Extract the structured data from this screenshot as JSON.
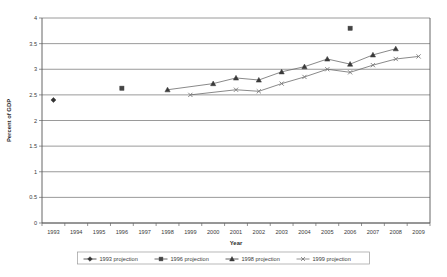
{
  "chart_data": {
    "type": "line",
    "title": "",
    "xlabel": "Year",
    "ylabel": "Percent of GDP",
    "xlim": [
      1993,
      2009
    ],
    "ylim": [
      0,
      4
    ],
    "ytick_step": 0.5,
    "grid": true,
    "legend_position": "bottom",
    "categories": [
      "1993",
      "1994",
      "1995",
      "1996",
      "1997",
      "1998",
      "1999",
      "2000",
      "2001",
      "2002",
      "2003",
      "2004",
      "2005",
      "2006",
      "2007",
      "2008",
      "2009"
    ],
    "ytick_labels": [
      "0",
      "0.5",
      "1",
      "1.5",
      "2",
      "2.5",
      "3",
      "3.5",
      "4"
    ],
    "series": [
      {
        "name": "1993 projection",
        "marker": "diamond",
        "color": "#333333",
        "points": [
          {
            "x": 1993,
            "y": 2.4
          }
        ]
      },
      {
        "name": "1996 projection",
        "marker": "square",
        "color": "#444444",
        "points": [
          {
            "x": 1996,
            "y": 2.63
          },
          {
            "x": 2006,
            "y": 3.8
          }
        ]
      },
      {
        "name": "1998 projection",
        "marker": "triangle",
        "color": "#3a3a3a",
        "points": [
          {
            "x": 1998,
            "y": 2.6
          },
          {
            "x": 2000,
            "y": 2.72
          },
          {
            "x": 2001,
            "y": 2.83
          },
          {
            "x": 2002,
            "y": 2.79
          },
          {
            "x": 2003,
            "y": 2.95
          },
          {
            "x": 2004,
            "y": 3.05
          },
          {
            "x": 2005,
            "y": 3.2
          },
          {
            "x": 2006,
            "y": 3.1
          },
          {
            "x": 2007,
            "y": 3.28
          },
          {
            "x": 2008,
            "y": 3.4
          }
        ]
      },
      {
        "name": "1999 projection",
        "marker": "cross",
        "color": "#7a7a7a",
        "points": [
          {
            "x": 1999,
            "y": 2.5
          },
          {
            "x": 2001,
            "y": 2.6
          },
          {
            "x": 2002,
            "y": 2.57
          },
          {
            "x": 2003,
            "y": 2.72
          },
          {
            "x": 2004,
            "y": 2.85
          },
          {
            "x": 2005,
            "y": 3.0
          },
          {
            "x": 2006,
            "y": 2.94
          },
          {
            "x": 2007,
            "y": 3.08
          },
          {
            "x": 2008,
            "y": 3.2
          },
          {
            "x": 2009,
            "y": 3.25
          }
        ]
      }
    ]
  },
  "legend": {
    "items": [
      {
        "label": "1993 projection",
        "marker": "diamond"
      },
      {
        "label": "1996 projection",
        "marker": "square"
      },
      {
        "label": "1998 projection",
        "marker": "triangle"
      },
      {
        "label": "1999 projection",
        "marker": "cross"
      }
    ]
  },
  "axes": {
    "x_title": "Year",
    "y_title": "Percent of GDP"
  }
}
